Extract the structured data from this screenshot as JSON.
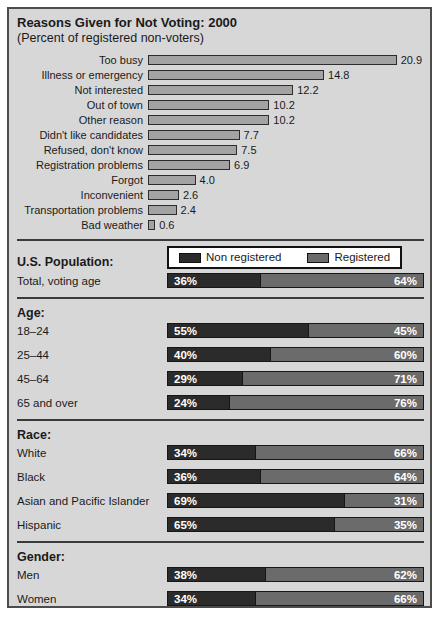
{
  "panel": {
    "title": "Reasons Given for Not Voting: 2000",
    "subtitle": "(Percent of registered non-voters)"
  },
  "colors": {
    "panel_bg": "#d7d7d7",
    "reason_bar": "#a3a3a3",
    "non_registered": "#2b2b2b",
    "registered": "#6b6b6b",
    "divider": "#3a3a3a"
  },
  "chart_data": [
    {
      "type": "bar",
      "orientation": "horizontal",
      "title": "Reasons Given for Not Voting: 2000",
      "subtitle": "(Percent of registered non-voters)",
      "categories": [
        "Too busy",
        "Illness or emergency",
        "Not interested",
        "Out of town",
        "Other reason",
        "Didn't like candidates",
        "Refused, don't know",
        "Registration problems",
        "Forgot",
        "Inconvenient",
        "Transportation problems",
        "Bad weather"
      ],
      "values": [
        20.9,
        14.8,
        12.2,
        10.2,
        10.2,
        7.7,
        7.5,
        6.9,
        4.0,
        2.6,
        2.4,
        0.6
      ],
      "value_labels": [
        "20.9",
        "14.8",
        "12.2",
        "10.2",
        "10.2",
        "7.7",
        "7.5",
        "6.9",
        "4.0",
        "2.6",
        "2.4",
        "0.6"
      ],
      "xlabel": "",
      "ylabel": "",
      "xlim": [
        0,
        23.2
      ],
      "grid": false,
      "data_labels": true
    },
    {
      "type": "bar",
      "subtype": "stacked-horizontal-percent",
      "units": "%",
      "legend": [
        "Non registered",
        "Registered"
      ],
      "legend_position": "top",
      "xlim": [
        0,
        100
      ],
      "sections": [
        {
          "heading": "U.S. Population:",
          "rows": [
            {
              "label": "Total, voting age",
              "non_registered": 36,
              "registered": 64
            }
          ]
        },
        {
          "heading": "Age:",
          "rows": [
            {
              "label": "18–24",
              "non_registered": 55,
              "registered": 45
            },
            {
              "label": "25–44",
              "non_registered": 40,
              "registered": 60
            },
            {
              "label": "45–64",
              "non_registered": 29,
              "registered": 71
            },
            {
              "label": "65 and over",
              "non_registered": 24,
              "registered": 76
            }
          ]
        },
        {
          "heading": "Race:",
          "rows": [
            {
              "label": "White",
              "non_registered": 34,
              "registered": 66
            },
            {
              "label": "Black",
              "non_registered": 36,
              "registered": 64
            },
            {
              "label": "Asian and Pacific Islander",
              "non_registered": 69,
              "registered": 31
            },
            {
              "label": "Hispanic",
              "non_registered": 65,
              "registered": 35
            }
          ]
        },
        {
          "heading": "Gender:",
          "rows": [
            {
              "label": "Men",
              "non_registered": 38,
              "registered": 62
            },
            {
              "label": "Women",
              "non_registered": 34,
              "registered": 66
            }
          ]
        }
      ]
    }
  ]
}
